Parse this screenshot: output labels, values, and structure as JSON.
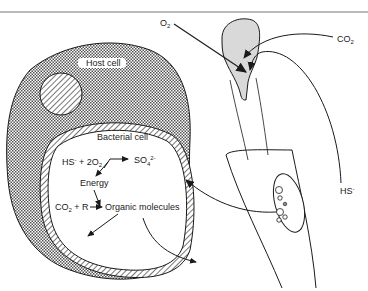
{
  "diagram": {
    "labels": {
      "host_cell": "Host cell",
      "bacterial_cell": "Bacterial cell",
      "o2": "O",
      "o2_sub": "2",
      "co2": "CO",
      "co2_sub": "2",
      "hs": "HS",
      "hs_sup": "-"
    },
    "reactions": {
      "r1_left": "HS",
      "r1_left_sup": "-",
      "r1_plus": " + 2O",
      "r1_sub": "2",
      "r1_product": "SO",
      "r1_product_sub": "4",
      "r1_product_sup": "2-",
      "energy": "Energy",
      "r2_left": "CO",
      "r2_left_sub": "2",
      "r2_plus": " + R",
      "r2_product": "Organic molecules"
    },
    "colors": {
      "line": "#1a1a1a",
      "stipple": "#555555",
      "plume": "#d9d9d9",
      "background": "#ffffff"
    }
  }
}
